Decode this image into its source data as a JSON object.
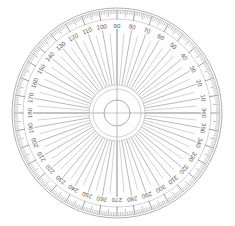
{
  "figure": {
    "kind": "protractor",
    "background_color": "#ffffff",
    "line_color": "#8d8d8d",
    "label_color": "#5d5d5d"
  },
  "geometry": {
    "width": 235,
    "height": 226,
    "center_x": 117,
    "center_y": 113,
    "outer_radius": 105,
    "tick_ring_outer_radius": 103,
    "tick_ring_inner_radius": 94,
    "label_radius": 87,
    "spoke_outer_radius": 80,
    "inner_ring_radius": 28,
    "inner_ring2_radius": 24,
    "hub_radius": 13
  },
  "scale": {
    "total_degrees": 360,
    "minor_step": 1,
    "mid_step": 5,
    "major_step": 10,
    "label_step": 10,
    "direction": "counter-clockwise",
    "zero_position": "right",
    "anchors": {
      "top": "90",
      "left": "180",
      "bottom": "270",
      "right": "360"
    },
    "labels": [
      "10",
      "20",
      "30",
      "40",
      "50",
      "60",
      "70",
      "80",
      "90",
      "100",
      "110",
      "120",
      "130",
      "140",
      "150",
      "160",
      "170",
      "180",
      "190",
      "200",
      "210",
      "220",
      "230",
      "240",
      "250",
      "260",
      "270",
      "280",
      "290",
      "300",
      "310",
      "320",
      "330",
      "340",
      "350",
      "360"
    ]
  },
  "center_mark": {
    "type": "crosshair-hole",
    "description": "white center hole with horizontal and vertical crosshair"
  }
}
